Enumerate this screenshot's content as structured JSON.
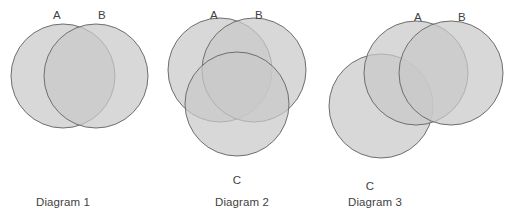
{
  "figure": {
    "background_color": "#ffffff",
    "width": 517,
    "height": 224,
    "style": {
      "circle_fill": "#c9c9c9",
      "circle_fill_opacity": 0.72,
      "circle_stroke": "#6e6e6e",
      "circle_stroke_width": 1,
      "two_way_overlap_color": "#a9a9a9",
      "three_way_overlap_color": "#8b8b8b",
      "label_color": "#3f3f3f"
    }
  },
  "diagrams": [
    {
      "id": "diagram-1",
      "caption": "Diagram 1",
      "caption_x": 36,
      "caption_y": 206,
      "circle_radius": 52,
      "sets": [
        {
          "name": "A",
          "cx": 63,
          "cy": 76,
          "label": "A",
          "label_x": 57,
          "label_y": 19
        },
        {
          "name": "B",
          "cx": 96,
          "cy": 76,
          "label": "B",
          "label_y": 19,
          "label_x": 102
        }
      ],
      "overlaps": [
        "A∩B"
      ]
    },
    {
      "id": "diagram-2",
      "caption": "Diagram 2",
      "caption_x": 215,
      "caption_y": 206,
      "circle_radius": 52,
      "sets": [
        {
          "name": "A",
          "cx": 220,
          "cy": 70,
          "label": "A",
          "label_x": 214,
          "label_y": 19
        },
        {
          "name": "B",
          "cx": 254,
          "cy": 70,
          "label": "B",
          "label_x": 259,
          "label_y": 19
        },
        {
          "name": "C",
          "cx": 237,
          "cy": 104,
          "label": "C",
          "label_x": 237,
          "label_y": 184
        }
      ],
      "overlaps": [
        "A∩B",
        "A∩C",
        "B∩C",
        "A∩B∩C"
      ]
    },
    {
      "id": "diagram-3",
      "caption": "Diagram 3",
      "caption_x": 348,
      "caption_y": 206,
      "circle_radius": 52,
      "sets": [
        {
          "name": "A",
          "cx": 416,
          "cy": 73,
          "label": "A",
          "label_x": 418,
          "label_y": 21
        },
        {
          "name": "B",
          "cx": 451,
          "cy": 73,
          "label": "B",
          "label_x": 462,
          "label_y": 21
        },
        {
          "name": "C",
          "cx": 381,
          "cy": 106,
          "label": "C",
          "label_x": 370,
          "label_y": 190
        }
      ],
      "overlaps": [
        "A∩B",
        "A∩C"
      ]
    }
  ]
}
